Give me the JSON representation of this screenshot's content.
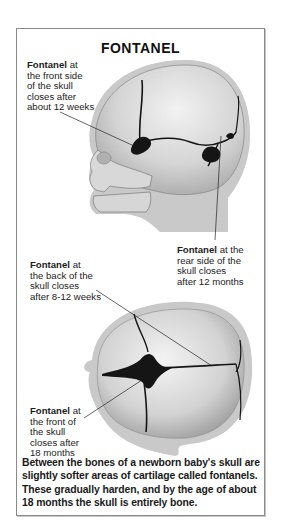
{
  "title": "FONTANEL",
  "labels": {
    "front_side": {
      "bold": "Fontanel",
      "lines": [
        "at",
        "the front side",
        "of the skull",
        "closes after",
        "about 12 weeks"
      ]
    },
    "rear_side": {
      "bold": "Fontanel",
      "lines": [
        "at the",
        "rear side of the",
        "skull closes",
        "after 12 months"
      ]
    },
    "back": {
      "bold": "Fontanel",
      "lines": [
        "at",
        "the back of the",
        "skull closes",
        "after 8-12 weeks"
      ]
    },
    "front": {
      "bold": "Fontanel",
      "lines": [
        "at",
        "the front of",
        "the skull",
        "closes after",
        "18 months"
      ]
    }
  },
  "caption": "Between the bones of a newborn baby's skull are slightly softer areas of cartilage called fontanels. These gradually harden, and by the age of about 18 months the skull is entirely bone.",
  "illustrations": {
    "side_view": "infant-skull-side-view",
    "top_view": "infant-skull-top-view"
  },
  "colors": {
    "border": "#8a8a8a",
    "skull_light": "#e6e6e6",
    "skull_mid": "#bdbdbd",
    "halo": "#c9c9c9",
    "fontanel": "#151515"
  }
}
